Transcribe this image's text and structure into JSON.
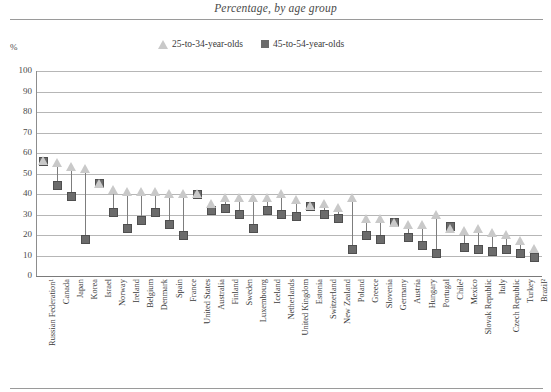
{
  "title": "Percentage, by age group",
  "axis": {
    "ylabel": "%",
    "yticks": [
      "100",
      "90",
      "80",
      "70",
      "60",
      "50",
      "40",
      "30",
      "20",
      "10",
      "0"
    ]
  },
  "legend": {
    "items": [
      {
        "label": "25-to-34-year-olds",
        "marker": "triangle-icon",
        "color": "#c9c9c9"
      },
      {
        "label": "45-to-54-year-olds",
        "marker": "square-icon",
        "color": "#6b6b6b"
      }
    ]
  },
  "chart_data": {
    "type": "scatter",
    "title": "Percentage, by age group",
    "xlabel": "",
    "ylabel": "%",
    "ylim": [
      0,
      100
    ],
    "grid": true,
    "legend_position": "top-center",
    "categories": [
      "Russian Federation¹",
      "Canada",
      "Japan",
      "Korea",
      "Israel",
      "Norway",
      "Ireland",
      "Belgium",
      "Denmark",
      "Spain",
      "France",
      "United States",
      "Australia",
      "Finland",
      "Sweden",
      "Luxembourg",
      "Iceland",
      "Netherlands",
      "United Kingdom",
      "Estonia",
      "Switzerland",
      "New Zealand",
      "Poland",
      "Greece",
      "Slovenia",
      "Germany",
      "Austria",
      "Hungary",
      "Portugal",
      "Chile²",
      "Mexico",
      "Slovak Republic",
      "Italy",
      "Czech Republic",
      "Turkey",
      "Brazil²"
    ],
    "series": [
      {
        "name": "25-to-34-year-olds",
        "marker": "triangle",
        "color": "#c9c9c9",
        "values": [
          56,
          55,
          53,
          52,
          45,
          42,
          41,
          41,
          41,
          40,
          40,
          40,
          35,
          38,
          38,
          38,
          38,
          40,
          37,
          34,
          35,
          33,
          38,
          28,
          28,
          26,
          25,
          25,
          30,
          23,
          22,
          23,
          21,
          20,
          17,
          13
        ]
      },
      {
        "name": "45-to-54-year-olds",
        "marker": "square",
        "color": "#6b6b6b",
        "values": [
          56,
          44,
          39,
          18,
          45,
          31,
          23,
          27,
          31,
          25,
          20,
          40,
          32,
          33,
          30,
          23,
          32,
          30,
          29,
          34,
          30,
          28,
          13,
          20,
          18,
          26,
          19,
          15,
          11,
          24,
          14,
          13,
          12,
          13,
          11,
          9
        ]
      }
    ]
  }
}
